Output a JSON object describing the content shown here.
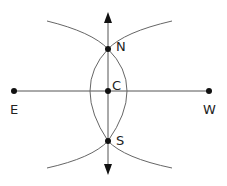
{
  "diagram": {
    "colors": {
      "line": "#555555",
      "arc": "#666666",
      "point": "#111111",
      "text": "#222222"
    },
    "points": [
      {
        "id": "N",
        "label": "N",
        "x": 108,
        "y": 49,
        "lx": 117,
        "ly": 51
      },
      {
        "id": "C",
        "label": "C",
        "x": 108,
        "y": 91,
        "lx": 113,
        "ly": 90
      },
      {
        "id": "S",
        "label": "S",
        "x": 108,
        "y": 141,
        "lx": 117,
        "ly": 145
      },
      {
        "id": "E",
        "label": "E",
        "x": 14,
        "y": 91,
        "lx": 10,
        "ly": 114
      },
      {
        "id": "W",
        "label": "W",
        "x": 209,
        "y": 91,
        "lx": 204,
        "ly": 114
      }
    ],
    "segments": [
      {
        "id": "east-west-line",
        "from": "E",
        "to": "W"
      },
      {
        "id": "north-south-line",
        "from": "N",
        "to": "S",
        "arrows": "both"
      }
    ]
  }
}
